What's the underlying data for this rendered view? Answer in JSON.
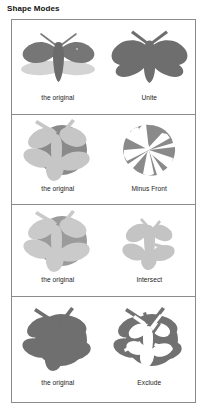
{
  "title": "Shape Modes",
  "figure": {
    "panels": [
      {
        "id": "unite",
        "left_label": "the original",
        "right_label": "Unite",
        "left_art": "moth-two-tone",
        "right_art": "moth-united-silhouette"
      },
      {
        "id": "minus-front",
        "left_label": "the original",
        "right_label": "Minus Front",
        "left_art": "circle-behind-light-pinwheel",
        "right_art": "pinwheel-minus-front"
      },
      {
        "id": "intersect",
        "left_label": "the original",
        "right_label": "Intersect",
        "left_art": "circle-behind-light-pinwheel",
        "right_art": "pinwheel-intersect-light"
      },
      {
        "id": "exclude",
        "left_label": "the original",
        "right_label": "Exclude",
        "left_art": "solid-dark-merged-blob",
        "right_art": "pinwheel-exclude-knockout"
      }
    ]
  },
  "colors": {
    "background": "#ffffff",
    "border": "#8b8b8b",
    "text": "#1a1a1a",
    "dark_gray": "#6e6e6e",
    "mid_gray": "#8f8f8f",
    "light_gray": "#b9b9b9",
    "pale_gray": "#cfcfcf",
    "very_light_gray": "#dcdcdc"
  }
}
